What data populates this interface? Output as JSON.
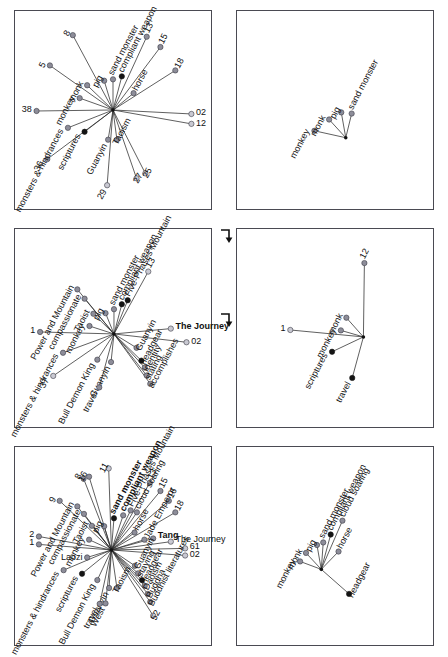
{
  "figure": {
    "title": "",
    "layout": "2 columns x 3 rows of network/star plots",
    "panel_count": 6,
    "arrows": [
      {
        "name": "arrow-top-to-middle",
        "glyph": "↳"
      },
      {
        "name": "arrow-middle-to-bottom",
        "glyph": "↳"
      }
    ],
    "colors": {
      "node_gray": "#8d8d99",
      "node_black": "#141414",
      "node_light": "#c9c9d2",
      "edge": "#2b2b2b",
      "panel_border": "#4a4a52",
      "background": "#ffffff"
    }
  },
  "chart_data": [
    {
      "type": "scatter",
      "name": "panel-top-left",
      "panel_index": 0,
      "title": "",
      "xlabel": "",
      "ylabel": "",
      "grid": false,
      "legend": "none",
      "center": {
        "x": 0.5,
        "y": 0.5
      },
      "nodes": [
        {
          "label": "8",
          "x": 0.295,
          "y": 0.122,
          "kind": "gray",
          "bold": false,
          "angle": -118,
          "rot": -62
        },
        {
          "label": "13",
          "x": 0.672,
          "y": 0.13,
          "kind": "gray",
          "bold": false,
          "angle": -62,
          "rot": -62
        },
        {
          "label": "15",
          "x": 0.742,
          "y": 0.182,
          "kind": "gray",
          "bold": false,
          "angle": -55,
          "rot": -62
        },
        {
          "label": "18",
          "x": 0.818,
          "y": 0.3,
          "kind": "gray",
          "bold": false,
          "angle": -40,
          "rot": -62
        },
        {
          "label": "5",
          "x": 0.178,
          "y": 0.275,
          "kind": "gray",
          "bold": false,
          "angle": -140,
          "rot": -62
        },
        {
          "label": "38",
          "x": 0.11,
          "y": 0.505,
          "kind": "gray",
          "bold": false,
          "angle": 180,
          "rot": 0
        },
        {
          "label": "36",
          "x": 0.165,
          "y": 0.748,
          "kind": "gray",
          "bold": false,
          "angle": 140,
          "rot": -62
        },
        {
          "label": "02",
          "x": 0.9,
          "y": 0.52,
          "kind": "light",
          "bold": false,
          "angle": 2,
          "rot": 0
        },
        {
          "label": "12",
          "x": 0.9,
          "y": 0.57,
          "kind": "light",
          "bold": false,
          "angle": 8,
          "rot": 0
        },
        {
          "label": "29",
          "x": 0.47,
          "y": 0.88,
          "kind": "light",
          "bold": false,
          "angle": 92,
          "rot": -62
        },
        {
          "label": "27",
          "x": 0.62,
          "y": 0.845,
          "kind": "light",
          "bold": false,
          "angle": 72,
          "rot": -62
        },
        {
          "label": "25",
          "x": 0.665,
          "y": 0.82,
          "kind": "light",
          "bold": false,
          "angle": 68,
          "rot": -62
        },
        {
          "label": "monk",
          "x": 0.368,
          "y": 0.375,
          "kind": "gray",
          "bold": false,
          "angle": -130,
          "rot": -62
        },
        {
          "label": "monkey",
          "x": 0.33,
          "y": 0.44,
          "kind": "gray",
          "bold": false,
          "angle": -160,
          "rot": -62
        },
        {
          "label": "pig",
          "x": 0.455,
          "y": 0.352,
          "kind": "gray",
          "bold": false,
          "angle": -100,
          "rot": -62
        },
        {
          "label": "sand monster",
          "x": 0.5,
          "y": 0.345,
          "kind": "gray",
          "bold": false,
          "angle": -92,
          "rot": -62
        },
        {
          "label": "compliant weapon",
          "x": 0.545,
          "y": 0.33,
          "kind": "black",
          "bold": false,
          "angle": -80,
          "rot": -62
        },
        {
          "label": "horse",
          "x": 0.605,
          "y": 0.415,
          "kind": "gray",
          "bold": false,
          "angle": -50,
          "rot": -62
        },
        {
          "label": "monsters & hindrances",
          "x": 0.27,
          "y": 0.59,
          "kind": "gray",
          "bold": false,
          "angle": 160,
          "rot": -62
        },
        {
          "label": "scriptures",
          "x": 0.355,
          "y": 0.61,
          "kind": "black",
          "bold": false,
          "angle": 150,
          "rot": -62
        },
        {
          "label": "Guanyin",
          "x": 0.475,
          "y": 0.65,
          "kind": "gray",
          "bold": false,
          "angle": 96,
          "rot": -62
        },
        {
          "label": "Taoism",
          "x": 0.52,
          "y": 0.65,
          "kind": "gray",
          "bold": false,
          "angle": 85,
          "rot": -62
        }
      ]
    },
    {
      "type": "scatter",
      "name": "panel-top-right",
      "panel_index": 1,
      "title": "",
      "xlabel": "",
      "ylabel": "",
      "grid": false,
      "legend": "none",
      "center": {
        "x": 0.555,
        "y": 0.64
      },
      "nodes": [
        {
          "label": "monkey",
          "x": 0.395,
          "y": 0.605,
          "kind": "gray",
          "bold": false,
          "rot": -62
        },
        {
          "label": "monk",
          "x": 0.47,
          "y": 0.548,
          "kind": "gray",
          "bold": false,
          "rot": -62
        },
        {
          "label": "pig",
          "x": 0.532,
          "y": 0.512,
          "kind": "gray",
          "bold": false,
          "rot": -62
        },
        {
          "label": "sand monster",
          "x": 0.585,
          "y": 0.518,
          "kind": "gray",
          "bold": false,
          "rot": -62
        }
      ]
    },
    {
      "type": "scatter",
      "name": "panel-middle-left",
      "panel_index": 2,
      "title": "",
      "xlabel": "",
      "ylabel": "",
      "grid": false,
      "legend": "none",
      "center": {
        "x": 0.505,
        "y": 0.53
      },
      "nodes": [
        {
          "label": "Power and Mountain",
          "x": 0.318,
          "y": 0.305,
          "kind": "gray",
          "bold": false,
          "rot": -62
        },
        {
          "label": "compassionate",
          "x": 0.355,
          "y": 0.352,
          "kind": "gray",
          "bold": false,
          "rot": -62
        },
        {
          "label": "Taoist",
          "x": 0.4,
          "y": 0.428,
          "kind": "gray",
          "bold": false,
          "rot": -62
        },
        {
          "label": "monkey",
          "x": 0.38,
          "y": 0.49,
          "kind": "gray",
          "bold": false,
          "rot": -62
        },
        {
          "label": "pig",
          "x": 0.462,
          "y": 0.425,
          "kind": "gray",
          "bold": false,
          "rot": -62
        },
        {
          "label": "sand monster",
          "x": 0.505,
          "y": 0.405,
          "kind": "gray",
          "bold": false,
          "rot": -62
        },
        {
          "label": "compliant weapon",
          "x": 0.545,
          "y": 0.38,
          "kind": "black",
          "bold": false,
          "rot": -62
        },
        {
          "label": "Five-Phases Mountain",
          "x": 0.575,
          "y": 0.36,
          "kind": "black",
          "bold": false,
          "rot": -62
        },
        {
          "label": "13",
          "x": 0.68,
          "y": 0.215,
          "kind": "light",
          "bold": false,
          "rot": -62
        },
        {
          "label": "1",
          "x": 0.128,
          "y": 0.52,
          "kind": "gray",
          "bold": false,
          "rot": 0
        },
        {
          "label": "The Journey",
          "x": 0.795,
          "y": 0.503,
          "kind": "light",
          "bold": true,
          "rot": 0
        },
        {
          "label": "02",
          "x": 0.875,
          "y": 0.572,
          "kind": "light",
          "bold": false,
          "rot": 0
        },
        {
          "label": "Guanyin",
          "x": 0.62,
          "y": 0.6,
          "kind": "gray",
          "bold": false,
          "rot": -62
        },
        {
          "label": "monsters & hindrances",
          "x": 0.245,
          "y": 0.625,
          "kind": "gray",
          "bold": false,
          "rot": -62
        },
        {
          "label": "37",
          "x": 0.195,
          "y": 0.742,
          "kind": "light",
          "bold": false,
          "rot": -62
        },
        {
          "label": "Bull Demon King",
          "x": 0.42,
          "y": 0.66,
          "kind": "gray",
          "bold": false,
          "rot": -62
        },
        {
          "label": "Guanyin",
          "x": 0.49,
          "y": 0.672,
          "kind": "gray",
          "bold": false,
          "rot": -62
        },
        {
          "label": "travel",
          "x": 0.43,
          "y": 0.8,
          "kind": "gray",
          "bold": false,
          "rot": -62
        },
        {
          "label": "headgear",
          "x": 0.645,
          "y": 0.665,
          "kind": "black",
          "bold": false,
          "rot": -62
        },
        {
          "label": "identity",
          "x": 0.662,
          "y": 0.7,
          "kind": "gray",
          "bold": false,
          "rot": -62
        },
        {
          "label": "stating",
          "x": 0.672,
          "y": 0.74,
          "kind": "gray",
          "bold": false,
          "rot": -62
        },
        {
          "label": "accomplishes",
          "x": 0.69,
          "y": 0.782,
          "kind": "gray",
          "bold": false,
          "rot": -62
        }
      ]
    },
    {
      "type": "scatter",
      "name": "panel-middle-right",
      "panel_index": 3,
      "title": "",
      "xlabel": "",
      "ylabel": "",
      "grid": false,
      "legend": "none",
      "center": {
        "x": 0.645,
        "y": 0.545
      },
      "nodes": [
        {
          "label": "12",
          "x": 0.65,
          "y": 0.172,
          "kind": "gray",
          "bold": false,
          "rot": -62
        },
        {
          "label": "monk",
          "x": 0.558,
          "y": 0.448,
          "kind": "gray",
          "bold": false,
          "rot": -62
        },
        {
          "label": "monkey",
          "x": 0.53,
          "y": 0.512,
          "kind": "gray",
          "bold": false,
          "rot": -62
        },
        {
          "label": "1",
          "x": 0.272,
          "y": 0.51,
          "kind": "light",
          "bold": false,
          "rot": 0
        },
        {
          "label": "scriptures",
          "x": 0.485,
          "y": 0.62,
          "kind": "black",
          "bold": false,
          "rot": -62
        },
        {
          "label": "travel",
          "x": 0.588,
          "y": 0.752,
          "kind": "black",
          "bold": false,
          "rot": -62
        }
      ]
    },
    {
      "type": "scatter",
      "name": "panel-bottom-left",
      "panel_index": 4,
      "title": "",
      "xlabel": "",
      "ylabel": "",
      "grid": false,
      "legend": "none",
      "center": {
        "x": 0.492,
        "y": 0.52
      },
      "nodes": [
        {
          "label": "11",
          "x": 0.478,
          "y": 0.108,
          "kind": "light",
          "bold": false,
          "rot": -62
        },
        {
          "label": "8",
          "x": 0.35,
          "y": 0.16,
          "kind": "gray",
          "bold": false,
          "rot": -62
        },
        {
          "label": "16",
          "x": 0.378,
          "y": 0.15,
          "kind": "gray",
          "bold": false,
          "rot": -62
        },
        {
          "label": "9",
          "x": 0.228,
          "y": 0.272,
          "kind": "gray",
          "bold": false,
          "rot": -62
        },
        {
          "label": "2",
          "x": 0.122,
          "y": 0.452,
          "kind": "gray",
          "bold": false,
          "rot": 0
        },
        {
          "label": "1",
          "x": 0.122,
          "y": 0.492,
          "kind": "gray",
          "bold": false,
          "rot": 0
        },
        {
          "label": "13",
          "x": 0.688,
          "y": 0.18,
          "kind": "gray",
          "bold": false,
          "rot": -62
        },
        {
          "label": "15",
          "x": 0.742,
          "y": 0.222,
          "kind": "gray",
          "bold": false,
          "rot": -62
        },
        {
          "label": "16",
          "x": 0.785,
          "y": 0.272,
          "kind": "gray",
          "bold": false,
          "rot": -62
        },
        {
          "label": "18",
          "x": 0.818,
          "y": 0.33,
          "kind": "gray",
          "bold": false,
          "rot": -62
        },
        {
          "label": "61",
          "x": 0.868,
          "y": 0.512,
          "kind": "light",
          "bold": false,
          "rot": 0
        },
        {
          "label": "02",
          "x": 0.868,
          "y": 0.548,
          "kind": "light",
          "bold": false,
          "rot": 0
        },
        {
          "label": "52",
          "x": 0.705,
          "y": 0.852,
          "kind": "light",
          "bold": false,
          "rot": -62
        },
        {
          "label": "The Journey",
          "x": 0.795,
          "y": 0.478,
          "kind": "light",
          "bold": false,
          "rot": 0
        },
        {
          "label": "Power and Mountain",
          "x": 0.318,
          "y": 0.3,
          "kind": "gray",
          "bold": false,
          "rot": -62
        },
        {
          "label": "compassionate",
          "x": 0.352,
          "y": 0.338,
          "kind": "gray",
          "bold": false,
          "rot": -62
        },
        {
          "label": "Taoist",
          "x": 0.392,
          "y": 0.398,
          "kind": "gray",
          "bold": false,
          "rot": -62
        },
        {
          "label": "monkey",
          "x": 0.378,
          "y": 0.468,
          "kind": "gray",
          "bold": false,
          "rot": -62
        },
        {
          "label": "pig",
          "x": 0.455,
          "y": 0.4,
          "kind": "gray",
          "bold": false,
          "rot": -62
        },
        {
          "label": "sand monster",
          "x": 0.505,
          "y": 0.36,
          "kind": "black",
          "bold": true,
          "rot": -62
        },
        {
          "label": "compliant weapon",
          "x": 0.552,
          "y": 0.345,
          "kind": "gray",
          "bold": true,
          "rot": -62
        },
        {
          "label": "Five-Phases Mountain",
          "x": 0.59,
          "y": 0.32,
          "kind": "gray",
          "bold": false,
          "rot": -62
        },
        {
          "label": "cloud soaring",
          "x": 0.622,
          "y": 0.33,
          "kind": "gray",
          "bold": false,
          "rot": -62
        },
        {
          "label": "horse",
          "x": 0.61,
          "y": 0.432,
          "kind": "gray",
          "bold": false,
          "rot": -62
        },
        {
          "label": "Jade Emperor",
          "x": 0.66,
          "y": 0.468,
          "kind": "gray",
          "bold": false,
          "rot": -62
        },
        {
          "label": "Tang",
          "x": 0.705,
          "y": 0.462,
          "kind": "gray",
          "bold": true,
          "rot": 0
        },
        {
          "label": "Laozi",
          "x": 0.368,
          "y": 0.558,
          "kind": "gray",
          "bold": false,
          "rot": 0
        },
        {
          "label": "monsters & hindrances",
          "x": 0.248,
          "y": 0.622,
          "kind": "gray",
          "bold": false,
          "rot": -62
        },
        {
          "label": "scriptures",
          "x": 0.342,
          "y": 0.64,
          "kind": "black",
          "bold": false,
          "rot": -62
        },
        {
          "label": "Bull Demon King",
          "x": 0.42,
          "y": 0.672,
          "kind": "gray",
          "bold": false,
          "rot": -62
        },
        {
          "label": "Guanyin",
          "x": 0.48,
          "y": 0.712,
          "kind": "gray",
          "bold": false,
          "rot": -62
        },
        {
          "label": "Taoism",
          "x": 0.52,
          "y": 0.712,
          "kind": "gray",
          "bold": false,
          "rot": -62
        },
        {
          "label": "travel",
          "x": 0.432,
          "y": 0.792,
          "kind": "gray",
          "bold": false,
          "rot": -62
        },
        {
          "label": "West",
          "x": 0.462,
          "y": 0.79,
          "kind": "gray",
          "bold": false,
          "rot": -62
        },
        {
          "label": "Guanyin",
          "x": 0.612,
          "y": 0.6,
          "kind": "gray",
          "bold": false,
          "rot": -62
        },
        {
          "label": "staying",
          "x": 0.628,
          "y": 0.638,
          "kind": "gray",
          "bold": false,
          "rot": -62
        },
        {
          "label": "headgear",
          "x": 0.648,
          "y": 0.672,
          "kind": "black",
          "bold": false,
          "rot": -62
        },
        {
          "label": "Daoism",
          "x": 0.662,
          "y": 0.702,
          "kind": "gray",
          "bold": false,
          "rot": -62
        },
        {
          "label": "Buddha",
          "x": 0.678,
          "y": 0.742,
          "kind": "gray",
          "bold": false,
          "rot": -62
        },
        {
          "label": "Buddhist literatures",
          "x": 0.69,
          "y": 0.782,
          "kind": "gray",
          "bold": false,
          "rot": -62
        }
      ]
    },
    {
      "type": "scatter",
      "name": "panel-bottom-right",
      "panel_index": 5,
      "title": "",
      "xlabel": "",
      "ylabel": "",
      "grid": false,
      "legend": "none",
      "center": {
        "x": 0.43,
        "y": 0.618
      },
      "nodes": [
        {
          "label": "monkey",
          "x": 0.322,
          "y": 0.578,
          "kind": "gray",
          "bold": false,
          "rot": -62
        },
        {
          "label": "monk",
          "x": 0.352,
          "y": 0.535,
          "kind": "gray",
          "bold": false,
          "rot": -62
        },
        {
          "label": "pig",
          "x": 0.408,
          "y": 0.495,
          "kind": "gray",
          "bold": false,
          "rot": -62
        },
        {
          "label": "sand monster",
          "x": 0.44,
          "y": 0.482,
          "kind": "gray",
          "bold": false,
          "rot": -62
        },
        {
          "label": "compliant weapon",
          "x": 0.478,
          "y": 0.442,
          "kind": "black",
          "bold": false,
          "rot": -62
        },
        {
          "label": "cloud soaring",
          "x": 0.538,
          "y": 0.372,
          "kind": "gray",
          "bold": false,
          "rot": -62
        },
        {
          "label": "horse",
          "x": 0.518,
          "y": 0.528,
          "kind": "gray",
          "bold": false,
          "rot": -62
        },
        {
          "label": "headgear",
          "x": 0.572,
          "y": 0.742,
          "kind": "black",
          "bold": false,
          "rot": -62
        }
      ]
    }
  ]
}
